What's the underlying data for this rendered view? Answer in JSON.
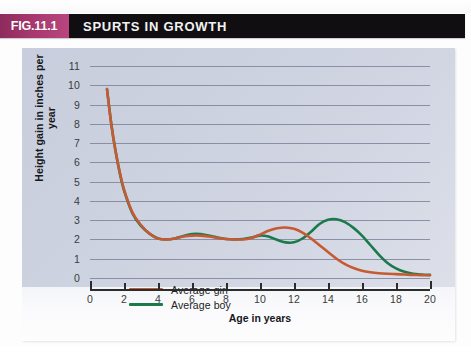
{
  "figure": {
    "badge": "FIG.11.1",
    "title": "SPURTS IN GROWTH",
    "badge_color": "#a8376f",
    "header_bg": "#100e11",
    "panel_bg": "#ccd1df"
  },
  "chart_data": {
    "type": "line",
    "title": "SPURTS IN GROWTH",
    "xlabel": "Age in years",
    "ylabel": "Height gain in inches per year",
    "xlim": [
      0,
      20
    ],
    "ylim": [
      0,
      11
    ],
    "xticks": [
      0,
      2,
      4,
      6,
      8,
      10,
      12,
      14,
      16,
      18,
      20
    ],
    "yticks": [
      0,
      1,
      2,
      3,
      4,
      5,
      6,
      7,
      8,
      9,
      10,
      11
    ],
    "grid": true,
    "legend_position": "inside-bottom-left",
    "series": [
      {
        "name": "Average girl",
        "color": "#c55a33",
        "x": [
          1.0,
          1.25,
          1.5,
          1.75,
          2.0,
          2.5,
          3.0,
          3.5,
          4.0,
          4.5,
          5.0,
          5.5,
          6.0,
          6.5,
          7.0,
          7.5,
          8.0,
          8.5,
          9.0,
          9.5,
          10.0,
          10.5,
          11.0,
          11.5,
          12.0,
          12.5,
          13.0,
          13.5,
          14.0,
          14.5,
          15.0,
          15.5,
          16.0,
          16.5,
          17.0,
          17.5,
          18.0,
          18.5,
          19.0,
          19.5,
          20.0
        ],
        "y": [
          9.8,
          8.0,
          6.6,
          5.5,
          4.6,
          3.4,
          2.75,
          2.3,
          2.05,
          2.0,
          2.05,
          2.15,
          2.2,
          2.2,
          2.15,
          2.08,
          2.02,
          2.0,
          2.0,
          2.08,
          2.25,
          2.45,
          2.58,
          2.62,
          2.55,
          2.35,
          2.05,
          1.7,
          1.35,
          1.0,
          0.72,
          0.52,
          0.38,
          0.3,
          0.25,
          0.22,
          0.2,
          0.18,
          0.16,
          0.15,
          0.14
        ]
      },
      {
        "name": "Average boy",
        "color": "#1b7a4b",
        "x": [
          1.0,
          1.25,
          1.5,
          1.75,
          2.0,
          2.5,
          3.0,
          3.5,
          4.0,
          4.5,
          5.0,
          5.5,
          6.0,
          6.5,
          7.0,
          7.5,
          8.0,
          8.5,
          9.0,
          9.5,
          10.0,
          10.5,
          11.0,
          11.5,
          12.0,
          12.5,
          13.0,
          13.5,
          14.0,
          14.5,
          15.0,
          15.5,
          16.0,
          16.5,
          17.0,
          17.5,
          18.0,
          18.5,
          19.0,
          19.5,
          20.0
        ],
        "y": [
          9.8,
          8.0,
          6.6,
          5.45,
          4.55,
          3.35,
          2.7,
          2.3,
          2.05,
          2.0,
          2.05,
          2.18,
          2.28,
          2.28,
          2.2,
          2.1,
          2.02,
          2.0,
          2.02,
          2.1,
          2.2,
          2.15,
          1.98,
          1.85,
          1.85,
          2.05,
          2.4,
          2.8,
          3.02,
          3.05,
          2.9,
          2.6,
          2.2,
          1.7,
          1.2,
          0.78,
          0.5,
          0.32,
          0.22,
          0.18,
          0.16
        ]
      }
    ]
  },
  "legend": [
    {
      "label": "Average girl",
      "color": "#c55a33"
    },
    {
      "label": "Average boy",
      "color": "#1b7a4b"
    }
  ]
}
